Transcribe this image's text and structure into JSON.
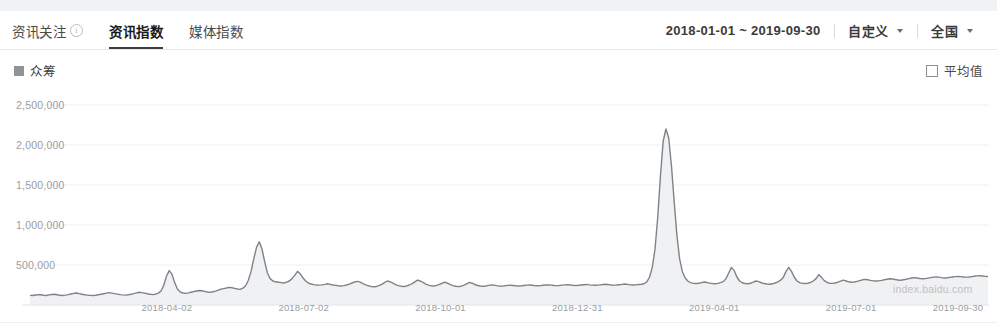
{
  "header": {
    "tabs": [
      {
        "label": "资讯关注",
        "active": false,
        "has_info_icon": true,
        "info_icon": "info-circle-icon"
      },
      {
        "label": "资讯指数",
        "active": true,
        "has_info_icon": false
      },
      {
        "label": "媒体指数",
        "active": false,
        "has_info_icon": false
      }
    ],
    "date_range": "2018-01-01 ~ 2019-09-30",
    "range_dropdown": {
      "label": "自定义",
      "icon": "chevron-down-icon"
    },
    "region_dropdown": {
      "label": "全国",
      "icon": "chevron-down-icon"
    }
  },
  "legend": {
    "series_label": "众筹",
    "series_color": "#8f9296",
    "average_label": "平均值",
    "average_checked": false
  },
  "watermark": "index.baidu.com",
  "chart_data": {
    "type": "area",
    "title": "",
    "xlabel": "",
    "ylabel": "",
    "grid": true,
    "legend_position": "top-left",
    "ylim": [
      0,
      2500000
    ],
    "ytick_labels": [
      "2,500,000",
      "2,000,000",
      "1,500,000",
      "1,000,000",
      "500,000"
    ],
    "yticks": [
      2500000,
      2000000,
      1500000,
      1000000,
      500000
    ],
    "xtick_labels": [
      "2018-04-02",
      "2018-07-02",
      "2018-10-01",
      "2018-12-31",
      "2019-04-01",
      "2019-07-01",
      "2019-09-30"
    ],
    "x_start": "2018-01-01",
    "x_end": "2019-09-30",
    "series": [
      {
        "name": "众筹",
        "color": "#7f8287",
        "fill": "#f0f1f2",
        "values": [
          120000,
          118000,
          125000,
          130000,
          128000,
          122000,
          119000,
          126000,
          131000,
          135000,
          128000,
          121000,
          118000,
          123000,
          130000,
          138000,
          145000,
          150000,
          142000,
          135000,
          128000,
          124000,
          120000,
          118000,
          122000,
          128000,
          134000,
          141000,
          148000,
          155000,
          149000,
          142000,
          136000,
          130000,
          126000,
          123000,
          128000,
          135000,
          143000,
          152000,
          160000,
          155000,
          148000,
          140000,
          134000,
          130000,
          135000,
          148000,
          175000,
          245000,
          360000,
          430000,
          385000,
          280000,
          200000,
          165000,
          150000,
          145000,
          152000,
          160000,
          168000,
          175000,
          182000,
          178000,
          170000,
          162000,
          158000,
          165000,
          174000,
          186000,
          198000,
          205000,
          212000,
          220000,
          215000,
          208000,
          200000,
          195000,
          210000,
          240000,
          310000,
          420000,
          580000,
          720000,
          790000,
          700000,
          540000,
          400000,
          330000,
          300000,
          290000,
          285000,
          280000,
          275000,
          285000,
          300000,
          330000,
          370000,
          420000,
          390000,
          340000,
          300000,
          275000,
          262000,
          255000,
          250000,
          248000,
          252000,
          258000,
          265000,
          258000,
          250000,
          245000,
          240000,
          238000,
          242000,
          250000,
          262000,
          275000,
          288000,
          295000,
          285000,
          268000,
          252000,
          240000,
          232000,
          228000,
          232000,
          245000,
          262000,
          282000,
          300000,
          290000,
          272000,
          255000,
          242000,
          235000,
          232000,
          238000,
          250000,
          268000,
          290000,
          312000,
          300000,
          282000,
          262000,
          248000,
          240000,
          238000,
          245000,
          258000,
          272000,
          285000,
          272000,
          255000,
          242000,
          234000,
          230000,
          235000,
          248000,
          265000,
          282000,
          272000,
          256000,
          244000,
          238000,
          235000,
          238000,
          245000,
          252000,
          248000,
          242000,
          238000,
          236000,
          240000,
          245000,
          248000,
          244000,
          240000,
          238000,
          240000,
          244000,
          248000,
          250000,
          246000,
          242000,
          240000,
          242000,
          246000,
          250000,
          252000,
          248000,
          244000,
          242000,
          244000,
          248000,
          252000,
          255000,
          250000,
          246000,
          244000,
          246000,
          250000,
          254000,
          258000,
          252000,
          248000,
          246000,
          248000,
          252000,
          256000,
          260000,
          255000,
          250000,
          248000,
          250000,
          254000,
          258000,
          262000,
          258000,
          252000,
          250000,
          252000,
          256000,
          260000,
          265000,
          290000,
          350000,
          470000,
          700000,
          1100000,
          1620000,
          2050000,
          2200000,
          2090000,
          1750000,
          1300000,
          880000,
          580000,
          420000,
          340000,
          300000,
          280000,
          270000,
          268000,
          272000,
          280000,
          288000,
          282000,
          274000,
          268000,
          265000,
          270000,
          280000,
          292000,
          330000,
          400000,
          470000,
          430000,
          350000,
          300000,
          278000,
          268000,
          265000,
          272000,
          285000,
          300000,
          292000,
          278000,
          268000,
          262000,
          260000,
          265000,
          275000,
          290000,
          310000,
          345000,
          420000,
          470000,
          420000,
          350000,
          300000,
          280000,
          270000,
          268000,
          272000,
          282000,
          300000,
          330000,
          380000,
          345000,
          305000,
          282000,
          272000,
          270000,
          275000,
          285000,
          298000,
          310000,
          300000,
          290000,
          285000,
          288000,
          295000,
          305000,
          315000,
          320000,
          315000,
          308000,
          302000,
          300000,
          302000,
          308000,
          315000,
          322000,
          328000,
          325000,
          318000,
          312000,
          310000,
          315000,
          322000,
          330000,
          338000,
          342000,
          338000,
          332000,
          328000,
          330000,
          336000,
          342000,
          348000,
          352000,
          348000,
          342000,
          338000,
          340000,
          345000,
          350000,
          355000,
          358000,
          355000,
          350000,
          348000,
          350000,
          355000,
          360000,
          364000,
          366000,
          362000,
          358000,
          356000
        ]
      }
    ]
  }
}
